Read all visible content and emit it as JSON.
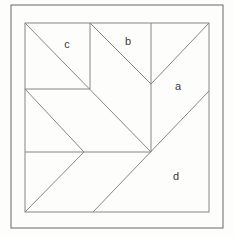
{
  "figure": {
    "canvas": {
      "width": 234,
      "height": 235,
      "background": "#fdfdfb"
    },
    "stroke": {
      "outer_border_color": "#686868",
      "line_color": "#868686",
      "width": 1
    },
    "outer_border": {
      "x": 11,
      "y": 5,
      "width": 212,
      "height": 223
    },
    "inner_square": {
      "x": 25,
      "y": 23,
      "width": 184,
      "height": 189
    },
    "segments": [
      {
        "name": "c-square-right-edge",
        "x1": 90,
        "y1": 23,
        "x2": 90,
        "y2": 89
      },
      {
        "name": "c-square-bottom-edge",
        "x1": 25,
        "y1": 89,
        "x2": 90,
        "y2": 89
      },
      {
        "name": "main-diagonal",
        "x1": 25,
        "y1": 23,
        "x2": 151,
        "y2": 152
      },
      {
        "name": "b-left-diagonal",
        "x1": 90,
        "y1": 23,
        "x2": 151,
        "y2": 84
      },
      {
        "name": "b-right-diagonal",
        "x1": 151,
        "y1": 84,
        "x2": 209,
        "y2": 23
      },
      {
        "name": "center-vertical",
        "x1": 151,
        "y1": 23,
        "x2": 151,
        "y2": 152
      },
      {
        "name": "long-diagonal-d",
        "x1": 209,
        "y1": 91,
        "x2": 93,
        "y2": 212
      },
      {
        "name": "middle-horizontal",
        "x1": 25,
        "y1": 152,
        "x2": 151,
        "y2": 152
      },
      {
        "name": "chevron-upper-diagonal",
        "x1": 25,
        "y1": 89,
        "x2": 84,
        "y2": 152
      },
      {
        "name": "chevron-lower-diagonal",
        "x1": 84,
        "y1": 152,
        "x2": 25,
        "y2": 212
      }
    ],
    "labels": [
      {
        "id": "a",
        "text": "a",
        "x": 178,
        "y": 87
      },
      {
        "id": "b",
        "text": "b",
        "x": 128,
        "y": 42
      },
      {
        "id": "c",
        "text": "c",
        "x": 67,
        "y": 45
      },
      {
        "id": "d",
        "text": "d",
        "x": 176,
        "y": 177
      }
    ],
    "label_color": "#383838"
  }
}
